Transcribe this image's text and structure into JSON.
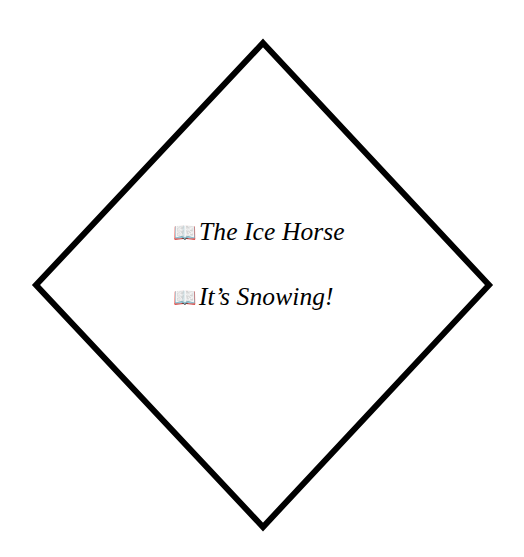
{
  "canvas": {
    "width": 524,
    "height": 557,
    "background_color": "#ffffff"
  },
  "shape": {
    "name": "diamond",
    "type": "rotated-square-outline",
    "stroke_color": "#000000",
    "fill_color": "none",
    "stroke_width": 6,
    "vertices": {
      "top": [
        263,
        43
      ],
      "right": [
        489,
        285
      ],
      "bottom": [
        263,
        527
      ],
      "left": [
        36,
        285
      ]
    }
  },
  "list": {
    "items": [
      {
        "icon": "open-book-icon",
        "icon_glyph": "📖",
        "label": "The Ice Horse"
      },
      {
        "icon": "open-book-icon",
        "icon_glyph": "📖",
        "label": "It’s Snowing!"
      }
    ]
  },
  "text_style": {
    "color": "#000000",
    "style": "italic-serif"
  }
}
